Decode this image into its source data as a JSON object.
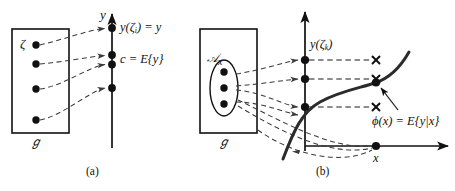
{
  "figure": {
    "caption_a": "(a)",
    "caption_b": "(b)",
    "panel_a": {
      "axis_label_y": "y",
      "sample_space_label": "ℊ",
      "outcome_label": "ζ",
      "value_label": "y(ζ",
      "value_label_sub": "i",
      "value_label_tail": ") = y",
      "mean_label": "c = E{y}",
      "dot_count_domain": 4,
      "dot_count_axis": 4
    },
    "panel_b": {
      "axis_label_y": "",
      "axis_label_x": "x",
      "sample_space_label": "ℊ",
      "event_label": "𝒜",
      "event_label_sub": "x",
      "value_label": "y(ζ",
      "value_label_sub": "k",
      "value_label_tail": ")",
      "curve_label": "ϕ(x) = E{y|x}",
      "dot_count_event": 3,
      "dot_count_axis": 3,
      "cross_count": 3
    }
  },
  "colors": {
    "ink": "#111111",
    "dashed": "#3a3a3a",
    "curve": "#2b2b2b",
    "background": "#ffffff"
  }
}
